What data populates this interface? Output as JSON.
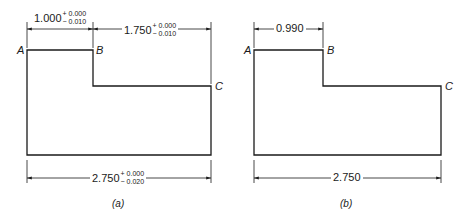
{
  "panels": [
    {
      "caption": "(a)",
      "points": {
        "A": "A",
        "B": "B",
        "C": "C"
      },
      "dims": {
        "ab": {
          "nominal": "1.000",
          "upper": "+ 0.000",
          "lower": "− 0.010"
        },
        "bc": {
          "nominal": "1.750",
          "upper": "+ 0.000",
          "lower": "− 0.010"
        },
        "ac": {
          "nominal": "2.750",
          "upper": "+ 0.000",
          "lower": "− 0.020"
        }
      }
    },
    {
      "caption": "(b)",
      "points": {
        "A": "A",
        "B": "B",
        "C": "C"
      },
      "dims": {
        "ab": {
          "nominal": "0.990"
        },
        "ac": {
          "nominal": "2.750"
        }
      }
    }
  ],
  "colors": {
    "line": "#1a1a1a",
    "background": "#ffffff"
  }
}
